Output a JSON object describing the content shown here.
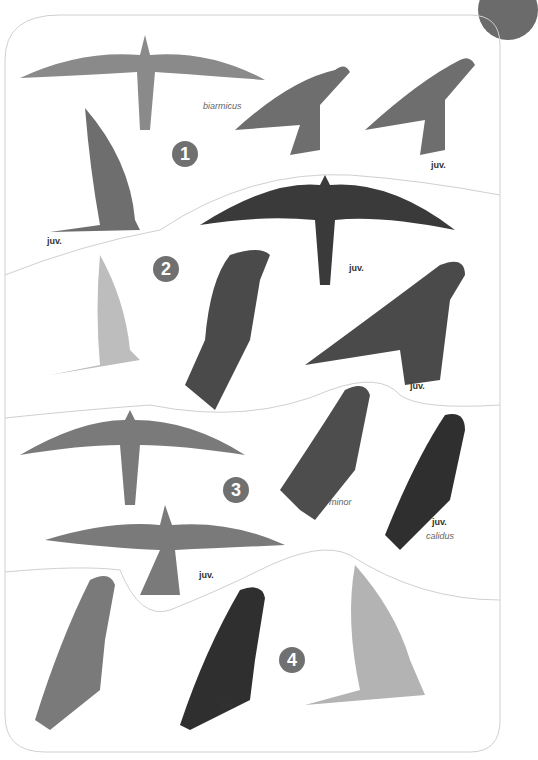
{
  "plate": {
    "sections": [
      {
        "number": "1",
        "labels": [
          {
            "text": "biarmicus",
            "style": "italic",
            "x": 203,
            "y": 101
          },
          {
            "text": "juv.",
            "style": "bold",
            "x": 431,
            "y": 160
          },
          {
            "text": "juv.",
            "style": "bold",
            "x": 47,
            "y": 236
          }
        ]
      },
      {
        "number": "2",
        "labels": [
          {
            "text": "juv.",
            "style": "bold",
            "x": 349,
            "y": 263
          },
          {
            "text": "juv.",
            "style": "bold",
            "x": 410,
            "y": 381
          }
        ]
      },
      {
        "number": "3",
        "labels": [
          {
            "text": "minor",
            "style": "italic",
            "x": 329,
            "y": 497
          },
          {
            "text": "juv.",
            "style": "bold",
            "x": 432,
            "y": 517
          },
          {
            "text": "calidus",
            "style": "italic",
            "x": 426,
            "y": 531
          },
          {
            "text": "juv.",
            "style": "bold",
            "x": 199,
            "y": 570
          }
        ]
      },
      {
        "number": "4",
        "labels": [
          {
            "text": "juv.",
            "style": "bold",
            "x": 220,
            "y": 700
          }
        ]
      }
    ],
    "colors": {
      "badge": "#707070",
      "divider": "#d0d0d0",
      "tab": "#6b6b6b",
      "background": "#ffffff"
    }
  }
}
